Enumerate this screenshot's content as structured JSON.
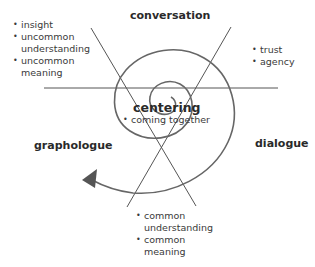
{
  "diagram": {
    "quadrants": {
      "top": "conversation",
      "left": "graphologue",
      "right": "dialogue"
    },
    "center": {
      "title": "centering",
      "bullet": "coming together"
    },
    "lists": {
      "top_left": [
        "insight",
        "uncommon understanding",
        "uncommon meaning"
      ],
      "top_right": [
        "trust",
        "agency"
      ],
      "bottom": [
        "common understanding",
        "common meaning"
      ]
    },
    "lines": {
      "color": "#555555",
      "spiral_color": "#666666",
      "arrow_color": "#555555"
    }
  }
}
